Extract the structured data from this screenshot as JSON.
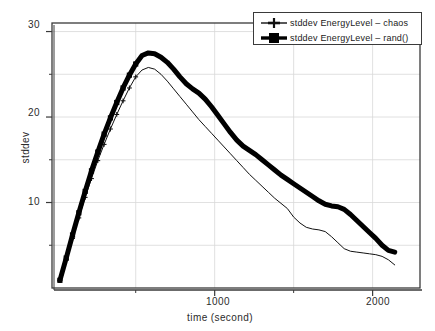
{
  "chart_data": {
    "type": "line",
    "title": "",
    "xlabel": "time (second)",
    "ylabel": "stddev",
    "xlim": [
      -30,
      2300
    ],
    "ylim": [
      0,
      31
    ],
    "grid": true,
    "legend_position": "top-right",
    "x_ticks_major": [
      1000,
      2000
    ],
    "x_ticks_major_labels": [
      "1000",
      "2000"
    ],
    "x_ticks_minor": [
      500,
      1500
    ],
    "y_ticks_major": [
      10,
      20,
      30
    ],
    "y_ticks_major_labels": [
      "10",
      "20",
      "30"
    ],
    "y_ticks_minor": [
      5,
      15,
      25
    ],
    "series": [
      {
        "name": "stddev EnergyLevel – chaos",
        "marker": "plus-icon",
        "line_width": 1,
        "color": "#111111",
        "x": [
          20,
          60,
          100,
          140,
          180,
          220,
          260,
          300,
          340,
          380,
          420,
          460,
          500,
          540,
          580,
          620,
          660,
          700,
          740,
          780,
          820,
          860,
          900,
          940,
          980,
          1020,
          1060,
          1100,
          1140,
          1180,
          1220,
          1260,
          1300,
          1340,
          1380,
          1420,
          1460,
          1500,
          1540,
          1580,
          1620,
          1660,
          1700,
          1740,
          1780,
          1820,
          1860,
          1900,
          1940,
          1980,
          2020,
          2060,
          2100,
          2140
        ],
        "y": [
          0.9,
          3.3,
          5.8,
          8.2,
          10.6,
          12.8,
          14.9,
          16.8,
          18.6,
          20.3,
          21.9,
          23.4,
          24.7,
          25.5,
          25.8,
          25.6,
          25.0,
          24.2,
          23.3,
          22.4,
          21.5,
          20.6,
          19.7,
          18.9,
          18.1,
          17.3,
          16.5,
          15.7,
          14.9,
          14.1,
          13.3,
          12.6,
          11.9,
          11.2,
          10.5,
          9.9,
          9.3,
          8.3,
          7.6,
          7.1,
          6.9,
          6.8,
          6.6,
          6.0,
          5.3,
          4.6,
          4.3,
          4.2,
          4.1,
          4.0,
          3.9,
          3.7,
          3.3,
          2.7
        ]
      },
      {
        "name": "stddev EnergyLevel – rand()",
        "marker": "filled-square-icon",
        "line_width": 5,
        "color": "#000000",
        "x": [
          20,
          60,
          100,
          140,
          180,
          220,
          260,
          300,
          340,
          380,
          420,
          460,
          500,
          540,
          580,
          620,
          660,
          700,
          740,
          780,
          820,
          860,
          900,
          940,
          980,
          1020,
          1060,
          1100,
          1140,
          1180,
          1220,
          1260,
          1300,
          1340,
          1380,
          1420,
          1460,
          1500,
          1540,
          1580,
          1620,
          1660,
          1700,
          1740,
          1780,
          1820,
          1860,
          1900,
          1940,
          1980,
          2020,
          2060,
          2100,
          2140
        ],
        "y": [
          0.9,
          3.5,
          6.2,
          8.8,
          11.3,
          13.7,
          15.9,
          18.0,
          19.9,
          21.7,
          23.4,
          24.9,
          26.2,
          27.2,
          27.5,
          27.4,
          27.0,
          26.4,
          25.6,
          24.7,
          23.9,
          23.3,
          22.8,
          22.1,
          21.2,
          20.2,
          19.2,
          18.2,
          17.3,
          16.6,
          16.1,
          15.6,
          15.0,
          14.4,
          13.8,
          13.2,
          12.7,
          12.2,
          11.7,
          11.2,
          10.7,
          10.2,
          9.8,
          9.6,
          9.5,
          9.2,
          8.6,
          7.9,
          7.2,
          6.5,
          5.8,
          5.0,
          4.4,
          4.2
        ]
      }
    ]
  },
  "legend": {
    "entries": [
      {
        "label": "stddev EnergyLevel – chaos",
        "marker": "plus-icon"
      },
      {
        "label": "stddev EnergyLevel – rand()",
        "marker": "filled-square-icon"
      }
    ]
  },
  "axes": {
    "y_label": "stddev",
    "x_label": "time (second)",
    "y_tick_labels": [
      "30",
      "20",
      "10"
    ],
    "x_tick_labels": [
      "1000",
      "2000"
    ]
  },
  "colors": {
    "background": "#ffffff",
    "frame": "#3a3a3a",
    "grid": "#d8d8d8",
    "series_chaos": "#111111",
    "series_rand": "#000000",
    "text": "#1a1a1a"
  }
}
